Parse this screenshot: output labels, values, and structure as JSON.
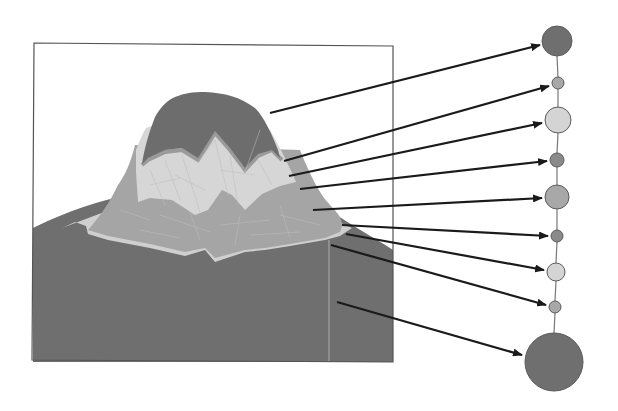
{
  "diagram": {
    "type": "terrain-to-level-tree",
    "colors": {
      "background": "#ffffff",
      "frame": "#555555",
      "band_dark": "#6f6f6f",
      "band_mid_dark": "#8a8a8a",
      "band_mid": "#a8a8a8",
      "band_light": "#d4d4d4",
      "band_edge": "#b8b8b8",
      "arrow": "#1a1a1a",
      "tree_edge": "#777777"
    },
    "terrain_panel": {
      "frame": {
        "x": 33,
        "y": 43,
        "width": 360,
        "height": 319
      }
    },
    "tree_nodes": [
      {
        "id": "n1",
        "cx": 557,
        "cy": 41,
        "r": 15,
        "shade": "dark"
      },
      {
        "id": "n2",
        "cx": 558,
        "cy": 83,
        "r": 6,
        "shade": "mid"
      },
      {
        "id": "n3",
        "cx": 558,
        "cy": 120,
        "r": 13,
        "shade": "light"
      },
      {
        "id": "n4",
        "cx": 557,
        "cy": 160,
        "r": 7,
        "shade": "mid_dark"
      },
      {
        "id": "n5",
        "cx": 557,
        "cy": 197,
        "r": 12,
        "shade": "mid"
      },
      {
        "id": "n6",
        "cx": 557,
        "cy": 236,
        "r": 6,
        "shade": "mid_dark"
      },
      {
        "id": "n7",
        "cx": 556,
        "cy": 272,
        "r": 9,
        "shade": "light"
      },
      {
        "id": "n8",
        "cx": 555,
        "cy": 307,
        "r": 6,
        "shade": "mid"
      },
      {
        "id": "n9",
        "cx": 554,
        "cy": 362,
        "r": 29,
        "shade": "dark"
      }
    ],
    "arrows": [
      {
        "from": [
          270,
          113
        ],
        "to": [
          540,
          45
        ],
        "target": "n1"
      },
      {
        "from": [
          284,
          161
        ],
        "to": [
          549,
          86
        ],
        "target": "n2"
      },
      {
        "from": [
          289,
          176
        ],
        "to": [
          542,
          123
        ],
        "target": "n3"
      },
      {
        "from": [
          300,
          189
        ],
        "to": [
          547,
          161
        ],
        "target": "n4"
      },
      {
        "from": [
          313,
          210
        ],
        "to": [
          542,
          198
        ],
        "target": "n5"
      },
      {
        "from": [
          342,
          225
        ],
        "to": [
          548,
          236
        ],
        "target": "n6"
      },
      {
        "from": [
          346,
          234
        ],
        "to": [
          544,
          270
        ],
        "target": "n7"
      },
      {
        "from": [
          331,
          245
        ],
        "to": [
          546,
          305
        ],
        "target": "n8"
      },
      {
        "from": [
          337,
          302
        ],
        "to": [
          522,
          355
        ],
        "target": "n9"
      }
    ]
  }
}
